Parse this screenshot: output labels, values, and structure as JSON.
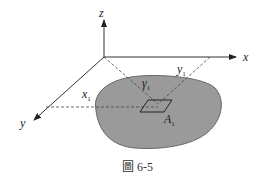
{
  "figure": {
    "caption": "圖 6-5",
    "axes": {
      "z_label": "z",
      "x_label": "x",
      "y_label": "y"
    },
    "annotations": {
      "x1_base": "x",
      "x1_sub": "1",
      "y1_base": "y",
      "y1_sub": "1",
      "gamma1_base": "γ",
      "gamma1_sub": "1",
      "A1_base": "A",
      "A1_sub": "1"
    },
    "colors": {
      "region_fill": "#9a9a9a",
      "line": "#333333",
      "dashed": "#555555"
    }
  }
}
